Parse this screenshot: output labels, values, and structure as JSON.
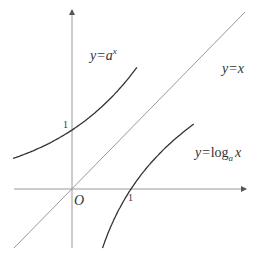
{
  "diagram": {
    "curves": [
      {
        "id": "exponential",
        "label_prefix": "y=",
        "label_base": "a",
        "label_sup": "x",
        "color": "#333333"
      },
      {
        "id": "identity",
        "label": "y=x",
        "color": "#888888"
      },
      {
        "id": "logarithm",
        "label_prefix": "y=",
        "label_func": "log",
        "label_sub": "a",
        "label_arg": "x",
        "color": "#333333"
      }
    ],
    "base_a": 2.0,
    "axes": {
      "origin_label": "O",
      "x_tick_label": "1",
      "y_tick_label": "1",
      "color": "#888888"
    }
  }
}
